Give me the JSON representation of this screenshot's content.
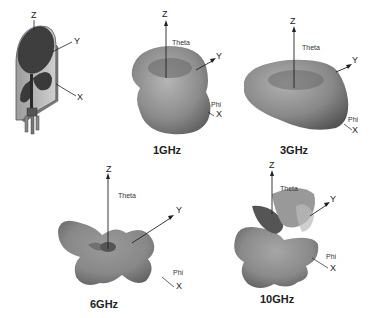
{
  "figure": {
    "antenna": {
      "axes": {
        "z": "Z",
        "y": "Y",
        "x": "X"
      }
    },
    "patterns": [
      {
        "frequency": "1GHz",
        "axes": {
          "z": "Z",
          "y": "Y",
          "x": "X",
          "theta": "Theta",
          "phi": "Phi"
        }
      },
      {
        "frequency": "3GHz",
        "axes": {
          "z": "Z",
          "y": "Y",
          "x": "X",
          "theta": "Theta",
          "phi": "Phi"
        }
      },
      {
        "frequency": "6GHz",
        "axes": {
          "z": "Z",
          "y": "Y",
          "x": "X",
          "theta": "Theta",
          "phi": "Phi"
        }
      },
      {
        "frequency": "10GHz",
        "axes": {
          "z": "Z",
          "y": "Y",
          "x": "X",
          "theta": "Theta",
          "phi": "Phi"
        }
      }
    ],
    "colors": {
      "pattern_fill": "#8a8a8a",
      "pattern_dark": "#4a4a4a",
      "pattern_light": "#bdbdbd",
      "substrate": "#b8b8b8",
      "metal": "#3a3a3a",
      "axis": "#222222"
    }
  }
}
